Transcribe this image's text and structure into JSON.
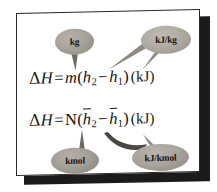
{
  "figure": {
    "frame_color": "#2a2724",
    "background_color": "#ffffff",
    "bubble_color": "#a6a29a",
    "text_color": "#17150f"
  },
  "equations": [
    {
      "id": "eq1",
      "delta": "Δ",
      "h_symbol": "H",
      "equals": "=",
      "mass_symbol": "m",
      "open_paren": "(",
      "term2_base": "h",
      "term2_sub": "2",
      "minus": "−",
      "term1_base": "h",
      "term1_sub": "1",
      "close_paren": ")",
      "unit": "(kJ)",
      "plain": "ΔH = m(h₂ − h₁)  (kJ)"
    },
    {
      "id": "eq2",
      "delta": "Δ",
      "h_symbol": "H",
      "equals": "=",
      "mass_symbol": "N",
      "open_paren": "(",
      "term2_base": "h",
      "term2_sub": "2",
      "minus": "−",
      "term1_base": "h",
      "term1_sub": "1",
      "close_paren": ")",
      "unit": "(kJ)",
      "plain": "ΔH = N(h̄₂ − h̄₁)  (kJ)"
    }
  ],
  "callouts": [
    {
      "id": "kg",
      "label": "kg",
      "points_to": "m"
    },
    {
      "id": "kjkg",
      "label": "kJ/kg",
      "points_to": "h2 and h1"
    },
    {
      "id": "kmol",
      "label": "kmol",
      "points_to": "N"
    },
    {
      "id": "kjkmol",
      "label": "kJ/kmol",
      "points_to": "h-bar 2 and h-bar 1"
    }
  ]
}
